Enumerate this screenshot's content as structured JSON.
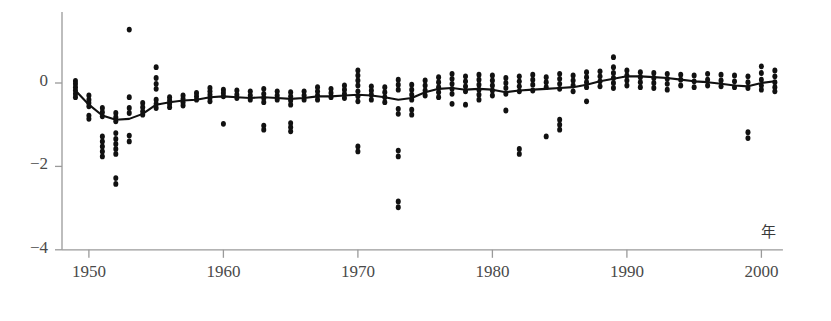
{
  "figure": {
    "title_cropped": "",
    "background": "#ffffff",
    "point_color": "#111111",
    "line_color": "#111111",
    "axis_color": "#9a9a9a"
  },
  "axes": {
    "x_unit_label": "年",
    "y_ticks": [
      0,
      -2,
      -4
    ],
    "y_tick_labels": [
      "0",
      "−2",
      "−4"
    ],
    "x_ticks": [
      1950,
      1960,
      1970,
      1980,
      1990,
      2000
    ],
    "x_tick_labels": [
      "1950",
      "1960",
      "1970",
      "1980",
      "1990",
      "2000"
    ],
    "xlim": [
      1948.0,
      2001.6
    ],
    "ylim": [
      -4.55,
      1.75
    ],
    "grid": false,
    "spines": [
      "left",
      "bottom"
    ]
  },
  "chart_data": {
    "type": "scatter",
    "title": "",
    "xlabel": "年",
    "ylabel": "",
    "xlim": [
      1948.0,
      2001.6
    ],
    "ylim": [
      -4.55,
      1.75
    ],
    "grid": false,
    "legend": "none",
    "series": [
      {
        "name": "observations",
        "type": "scatter",
        "marker": "filled-circle",
        "points": [
          [
            1949,
            0.05
          ],
          [
            1949,
            -0.02
          ],
          [
            1949,
            -0.1
          ],
          [
            1949,
            -0.18
          ],
          [
            1949,
            -0.26
          ],
          [
            1949,
            -0.34
          ],
          [
            1950,
            -0.3
          ],
          [
            1950,
            -0.4
          ],
          [
            1950,
            -0.48
          ],
          [
            1950,
            -0.56
          ],
          [
            1950,
            -0.78
          ],
          [
            1950,
            -0.86
          ],
          [
            1951,
            -0.6
          ],
          [
            1951,
            -0.7
          ],
          [
            1951,
            -0.8
          ],
          [
            1951,
            -1.28
          ],
          [
            1951,
            -1.4
          ],
          [
            1951,
            -1.52
          ],
          [
            1951,
            -1.64
          ],
          [
            1951,
            -1.76
          ],
          [
            1952,
            -0.72
          ],
          [
            1952,
            -0.82
          ],
          [
            1952,
            -0.92
          ],
          [
            1952,
            -1.2
          ],
          [
            1952,
            -1.34
          ],
          [
            1952,
            -1.46
          ],
          [
            1952,
            -1.58
          ],
          [
            1952,
            -1.7
          ],
          [
            1952,
            -2.28
          ],
          [
            1952,
            -2.42
          ],
          [
            1953,
            1.28
          ],
          [
            1953,
            -0.34
          ],
          [
            1953,
            -0.6
          ],
          [
            1953,
            -0.72
          ],
          [
            1953,
            -1.26
          ],
          [
            1953,
            -1.4
          ],
          [
            1954,
            -0.48
          ],
          [
            1954,
            -0.58
          ],
          [
            1954,
            -0.68
          ],
          [
            1954,
            -0.76
          ],
          [
            1955,
            0.38
          ],
          [
            1955,
            0.12
          ],
          [
            1955,
            -0.02
          ],
          [
            1955,
            -0.14
          ],
          [
            1955,
            -0.4
          ],
          [
            1955,
            -0.5
          ],
          [
            1955,
            -0.6
          ],
          [
            1956,
            -0.34
          ],
          [
            1956,
            -0.42
          ],
          [
            1956,
            -0.5
          ],
          [
            1956,
            -0.58
          ],
          [
            1957,
            -0.3
          ],
          [
            1957,
            -0.38
          ],
          [
            1957,
            -0.46
          ],
          [
            1957,
            -0.54
          ],
          [
            1958,
            -0.24
          ],
          [
            1958,
            -0.32
          ],
          [
            1958,
            -0.4
          ],
          [
            1959,
            -0.12
          ],
          [
            1959,
            -0.2
          ],
          [
            1959,
            -0.28
          ],
          [
            1959,
            -0.36
          ],
          [
            1959,
            -0.44
          ],
          [
            1960,
            -0.16
          ],
          [
            1960,
            -0.24
          ],
          [
            1960,
            -0.32
          ],
          [
            1960,
            -0.98
          ],
          [
            1961,
            -0.18
          ],
          [
            1961,
            -0.28
          ],
          [
            1961,
            -0.36
          ],
          [
            1962,
            -0.2
          ],
          [
            1962,
            -0.3
          ],
          [
            1962,
            -0.4
          ],
          [
            1963,
            -0.14
          ],
          [
            1963,
            -0.26
          ],
          [
            1963,
            -0.36
          ],
          [
            1963,
            -0.46
          ],
          [
            1963,
            -1.02
          ],
          [
            1963,
            -1.12
          ],
          [
            1964,
            -0.2
          ],
          [
            1964,
            -0.3
          ],
          [
            1964,
            -0.4
          ],
          [
            1965,
            -0.22
          ],
          [
            1965,
            -0.32
          ],
          [
            1965,
            -0.42
          ],
          [
            1965,
            -0.52
          ],
          [
            1965,
            -0.96
          ],
          [
            1965,
            -1.06
          ],
          [
            1965,
            -1.16
          ],
          [
            1966,
            -0.2
          ],
          [
            1966,
            -0.3
          ],
          [
            1966,
            -0.4
          ],
          [
            1967,
            -0.1
          ],
          [
            1967,
            -0.2
          ],
          [
            1967,
            -0.3
          ],
          [
            1967,
            -0.4
          ],
          [
            1968,
            -0.14
          ],
          [
            1968,
            -0.24
          ],
          [
            1968,
            -0.34
          ],
          [
            1969,
            -0.06
          ],
          [
            1969,
            -0.16
          ],
          [
            1969,
            -0.26
          ],
          [
            1969,
            -0.36
          ],
          [
            1970,
            0.3
          ],
          [
            1970,
            0.18
          ],
          [
            1970,
            0.06
          ],
          [
            1970,
            -0.06
          ],
          [
            1970,
            -0.2
          ],
          [
            1970,
            -0.32
          ],
          [
            1970,
            -0.44
          ],
          [
            1970,
            -1.52
          ],
          [
            1970,
            -1.64
          ],
          [
            1971,
            -0.08
          ],
          [
            1971,
            -0.18
          ],
          [
            1971,
            -0.28
          ],
          [
            1971,
            -0.4
          ],
          [
            1972,
            -0.1
          ],
          [
            1972,
            -0.22
          ],
          [
            1972,
            -0.34
          ],
          [
            1972,
            -0.46
          ],
          [
            1973,
            0.08
          ],
          [
            1973,
            -0.04
          ],
          [
            1973,
            -0.16
          ],
          [
            1973,
            -0.62
          ],
          [
            1973,
            -0.74
          ],
          [
            1973,
            -1.62
          ],
          [
            1973,
            -1.76
          ],
          [
            1973,
            -2.84
          ],
          [
            1973,
            -2.98
          ],
          [
            1974,
            -0.04
          ],
          [
            1974,
            -0.16
          ],
          [
            1974,
            -0.28
          ],
          [
            1974,
            -0.4
          ],
          [
            1974,
            -0.64
          ],
          [
            1974,
            -0.76
          ],
          [
            1975,
            0.06
          ],
          [
            1975,
            -0.06
          ],
          [
            1975,
            -0.18
          ],
          [
            1975,
            -0.3
          ],
          [
            1976,
            0.14
          ],
          [
            1976,
            0.02
          ],
          [
            1976,
            -0.1
          ],
          [
            1976,
            -0.22
          ],
          [
            1976,
            -0.34
          ],
          [
            1977,
            0.22
          ],
          [
            1977,
            0.1
          ],
          [
            1977,
            -0.02
          ],
          [
            1977,
            -0.14
          ],
          [
            1977,
            -0.26
          ],
          [
            1977,
            -0.5
          ],
          [
            1978,
            0.16
          ],
          [
            1978,
            0.04
          ],
          [
            1978,
            -0.08
          ],
          [
            1978,
            -0.2
          ],
          [
            1978,
            -0.52
          ],
          [
            1979,
            0.2
          ],
          [
            1979,
            0.08
          ],
          [
            1979,
            -0.04
          ],
          [
            1979,
            -0.16
          ],
          [
            1979,
            -0.28
          ],
          [
            1979,
            -0.4
          ],
          [
            1980,
            0.18
          ],
          [
            1980,
            0.06
          ],
          [
            1980,
            -0.06
          ],
          [
            1980,
            -0.18
          ],
          [
            1980,
            -0.3
          ],
          [
            1981,
            0.12
          ],
          [
            1981,
            0.0
          ],
          [
            1981,
            -0.12
          ],
          [
            1981,
            -0.26
          ],
          [
            1981,
            -0.66
          ],
          [
            1982,
            0.16
          ],
          [
            1982,
            0.04
          ],
          [
            1982,
            -0.08
          ],
          [
            1982,
            -0.2
          ],
          [
            1982,
            -1.58
          ],
          [
            1982,
            -1.7
          ],
          [
            1983,
            0.2
          ],
          [
            1983,
            0.08
          ],
          [
            1983,
            -0.04
          ],
          [
            1983,
            -0.18
          ],
          [
            1984,
            0.14
          ],
          [
            1984,
            0.02
          ],
          [
            1984,
            -0.1
          ],
          [
            1984,
            -1.28
          ],
          [
            1985,
            0.22
          ],
          [
            1985,
            0.1
          ],
          [
            1985,
            -0.02
          ],
          [
            1985,
            -0.14
          ],
          [
            1985,
            -0.88
          ],
          [
            1985,
            -1.0
          ],
          [
            1985,
            -1.12
          ],
          [
            1986,
            0.18
          ],
          [
            1986,
            0.06
          ],
          [
            1986,
            -0.06
          ],
          [
            1986,
            -0.2
          ],
          [
            1987,
            0.26
          ],
          [
            1987,
            0.14
          ],
          [
            1987,
            0.02
          ],
          [
            1987,
            -0.1
          ],
          [
            1987,
            -0.44
          ],
          [
            1988,
            0.28
          ],
          [
            1988,
            0.16
          ],
          [
            1988,
            0.04
          ],
          [
            1988,
            -0.08
          ],
          [
            1989,
            0.62
          ],
          [
            1989,
            0.38
          ],
          [
            1989,
            0.24
          ],
          [
            1989,
            0.12
          ],
          [
            1989,
            0.0
          ],
          [
            1989,
            -0.12
          ],
          [
            1990,
            0.3
          ],
          [
            1990,
            0.18
          ],
          [
            1990,
            0.06
          ],
          [
            1990,
            -0.06
          ],
          [
            1991,
            0.26
          ],
          [
            1991,
            0.14
          ],
          [
            1991,
            0.02
          ],
          [
            1991,
            -0.1
          ],
          [
            1992,
            0.24
          ],
          [
            1992,
            0.12
          ],
          [
            1992,
            0.0
          ],
          [
            1992,
            -0.12
          ],
          [
            1993,
            0.22
          ],
          [
            1993,
            0.1
          ],
          [
            1993,
            -0.02
          ],
          [
            1993,
            -0.16
          ],
          [
            1994,
            0.2
          ],
          [
            1994,
            0.08
          ],
          [
            1994,
            -0.06
          ],
          [
            1995,
            0.18
          ],
          [
            1995,
            0.04
          ],
          [
            1995,
            -0.1
          ],
          [
            1996,
            0.22
          ],
          [
            1996,
            0.08
          ],
          [
            1996,
            -0.06
          ],
          [
            1997,
            0.2
          ],
          [
            1997,
            0.06
          ],
          [
            1997,
            -0.08
          ],
          [
            1998,
            0.18
          ],
          [
            1998,
            0.04
          ],
          [
            1998,
            -0.1
          ],
          [
            1999,
            0.16
          ],
          [
            1999,
            0.02
          ],
          [
            1999,
            -0.12
          ],
          [
            1999,
            -1.18
          ],
          [
            1999,
            -1.32
          ],
          [
            2000,
            0.4
          ],
          [
            2000,
            0.24
          ],
          [
            2000,
            0.08
          ],
          [
            2000,
            -0.06
          ],
          [
            2000,
            -0.16
          ],
          [
            2001,
            0.3
          ],
          [
            2001,
            0.16
          ],
          [
            2001,
            0.02
          ],
          [
            2001,
            -0.1
          ],
          [
            2001,
            -0.2
          ]
        ]
      },
      {
        "name": "trend",
        "type": "line",
        "points": [
          [
            1949,
            -0.18
          ],
          [
            1950,
            -0.52
          ],
          [
            1951,
            -0.78
          ],
          [
            1952,
            -0.88
          ],
          [
            1953,
            -0.86
          ],
          [
            1954,
            -0.74
          ],
          [
            1955,
            -0.52
          ],
          [
            1956,
            -0.46
          ],
          [
            1957,
            -0.42
          ],
          [
            1958,
            -0.4
          ],
          [
            1959,
            -0.34
          ],
          [
            1960,
            -0.32
          ],
          [
            1961,
            -0.34
          ],
          [
            1962,
            -0.36
          ],
          [
            1963,
            -0.34
          ],
          [
            1964,
            -0.36
          ],
          [
            1965,
            -0.38
          ],
          [
            1966,
            -0.36
          ],
          [
            1967,
            -0.32
          ],
          [
            1968,
            -0.32
          ],
          [
            1969,
            -0.3
          ],
          [
            1970,
            -0.28
          ],
          [
            1971,
            -0.3
          ],
          [
            1972,
            -0.34
          ],
          [
            1973,
            -0.4
          ],
          [
            1974,
            -0.36
          ],
          [
            1975,
            -0.22
          ],
          [
            1976,
            -0.14
          ],
          [
            1977,
            -0.12
          ],
          [
            1978,
            -0.16
          ],
          [
            1979,
            -0.14
          ],
          [
            1980,
            -0.16
          ],
          [
            1981,
            -0.22
          ],
          [
            1982,
            -0.18
          ],
          [
            1983,
            -0.16
          ],
          [
            1984,
            -0.14
          ],
          [
            1985,
            -0.12
          ],
          [
            1986,
            -0.1
          ],
          [
            1987,
            -0.04
          ],
          [
            1988,
            0.04
          ],
          [
            1989,
            0.1
          ],
          [
            1990,
            0.16
          ],
          [
            1991,
            0.16
          ],
          [
            1992,
            0.14
          ],
          [
            1993,
            0.12
          ],
          [
            1994,
            0.08
          ],
          [
            1995,
            0.04
          ],
          [
            1996,
            0.02
          ],
          [
            1997,
            -0.02
          ],
          [
            1998,
            -0.06
          ],
          [
            1999,
            -0.08
          ],
          [
            2000,
            0.0
          ],
          [
            2001,
            0.04
          ]
        ]
      }
    ]
  }
}
